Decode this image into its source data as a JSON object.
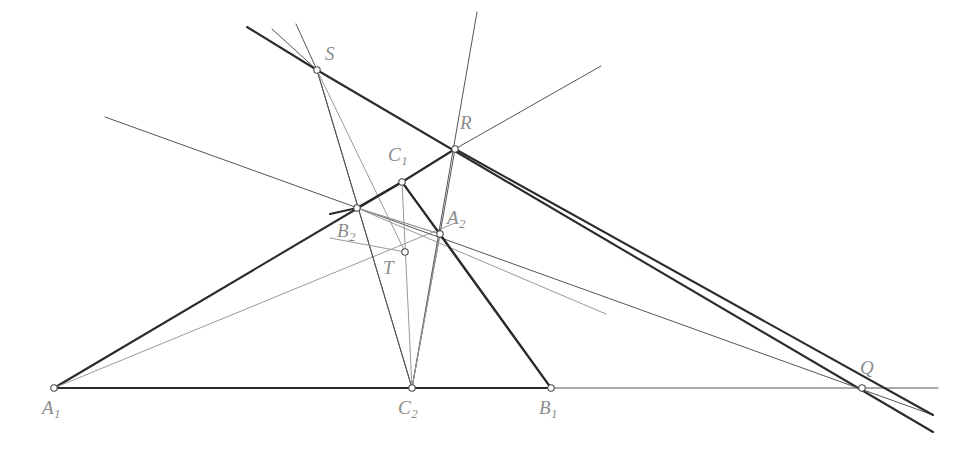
{
  "figure": {
    "background_color": "#ffffff",
    "canvas": {
      "width": 971,
      "height": 455
    }
  },
  "style": {
    "label_color": "#8c8c8c",
    "thick_line_color": "#2b2b2b",
    "thin_line_color": "#555555",
    "light_line_color": "#9a9a9a",
    "vertex_stroke": "#4a4a4a",
    "vertex_fill": "#ffffff",
    "thick_width": 2.1,
    "thin_width": 1.0,
    "light_width": 1.0,
    "vertex_radius": 3.2
  },
  "points": [
    {
      "id": "A1",
      "label": "A",
      "sub": "1",
      "x": 54,
      "y": 388,
      "label_x": 42,
      "label_y": 398
    },
    {
      "id": "B1",
      "label": "B",
      "sub": "1",
      "x": 551,
      "y": 388,
      "label_x": 539,
      "label_y": 398
    },
    {
      "id": "C2",
      "label": "C",
      "sub": "2",
      "x": 412,
      "y": 388,
      "label_x": 398,
      "label_y": 398
    },
    {
      "id": "B2",
      "label": "B",
      "sub": "2",
      "x": 357,
      "y": 208,
      "label_x": 337,
      "label_y": 221
    },
    {
      "id": "C1",
      "label": "C",
      "sub": "1",
      "x": 402,
      "y": 182,
      "label_x": 388,
      "label_y": 145
    },
    {
      "id": "A2",
      "label": "A",
      "sub": "2",
      "x": 440,
      "y": 234,
      "label_x": 447,
      "label_y": 208
    },
    {
      "id": "T",
      "label": "T",
      "sub": "",
      "x": 405,
      "y": 252,
      "label_x": 383,
      "label_y": 258
    },
    {
      "id": "S",
      "label": "S",
      "sub": "",
      "x": 317,
      "y": 70,
      "label_x": 325,
      "label_y": 44
    },
    {
      "id": "R",
      "label": "R",
      "sub": "",
      "x": 455,
      "y": 149,
      "label_x": 460,
      "label_y": 113
    },
    {
      "id": "Q",
      "label": "Q",
      "sub": "",
      "x": 862,
      "y": 388,
      "label_x": 860,
      "label_y": 358
    }
  ],
  "segments": [
    {
      "id": "base-line",
      "from": "A1",
      "to": "Q",
      "weight": "thin",
      "x1": 54,
      "y1": 388,
      "x2": 938,
      "y2": 388
    },
    {
      "id": "A1-B1-base-thick",
      "from": "A1",
      "to": "B1",
      "weight": "thick",
      "x1": 54,
      "y1": 388,
      "x2": 551,
      "y2": 388
    },
    {
      "id": "A1-C1-side",
      "from": "A1",
      "to": "C1",
      "weight": "thick",
      "x1": 54,
      "y1": 388,
      "x2": 402,
      "y2": 182
    },
    {
      "id": "C1-B1-side",
      "from": "C1",
      "to": "B1",
      "weight": "thick",
      "x1": 402,
      "y1": 182,
      "x2": 551,
      "y2": 388
    },
    {
      "id": "A1-A2-cevian",
      "from": "A1",
      "to": "A2",
      "weight": "light",
      "x1": 54,
      "y1": 388,
      "x2": 455,
      "y2": 223
    },
    {
      "id": "B2-A2-light",
      "from": "B2",
      "to": "A2",
      "weight": "light",
      "x1": 357,
      "y1": 208,
      "x2": 606,
      "y2": 314
    },
    {
      "id": "B1-A2-light",
      "from": "B1",
      "to": "A2",
      "weight": "light",
      "x1": 551,
      "y1": 388,
      "x2": 402,
      "y2": 182
    },
    {
      "id": "S-C2-cevian",
      "from": "S",
      "to": "C2",
      "weight": "thin",
      "x1": 317,
      "y1": 70,
      "x2": 412,
      "y2": 388
    },
    {
      "id": "R-C2-cevian",
      "from": "R",
      "to": "C2",
      "weight": "thin",
      "x1": 477,
      "y1": 12,
      "x2": 412,
      "y2": 388
    },
    {
      "id": "A2-C2-cevian",
      "from": "A2",
      "to": "C2",
      "weight": "thin",
      "x1": 440,
      "y1": 234,
      "x2": 412,
      "y2": 388
    },
    {
      "id": "S-up-thick",
      "from": "S",
      "to": "up",
      "weight": "thick",
      "x1": 317,
      "y1": 70,
      "x2": 247,
      "y2": 27
    },
    {
      "id": "S-up-thin-1",
      "from": "S",
      "to": "up",
      "weight": "thin",
      "x1": 317,
      "y1": 70,
      "x2": 272,
      "y2": 29
    },
    {
      "id": "S-up-thin-2",
      "from": "S",
      "to": "up",
      "weight": "thin",
      "x1": 317,
      "y1": 70,
      "x2": 296,
      "y2": 24
    },
    {
      "id": "S-Q-thick",
      "from": "S",
      "to": "Q",
      "weight": "thick",
      "x1": 317,
      "y1": 70,
      "x2": 933,
      "y2": 432
    },
    {
      "id": "S-B2-C2",
      "from": "S",
      "to": "C2",
      "weight": "thin",
      "x1": 317,
      "y1": 70,
      "x2": 412,
      "y2": 388
    },
    {
      "id": "perspectrix-B2RQ",
      "from": "B2",
      "to": "Q",
      "weight": "thin",
      "x1": 105,
      "y1": 117,
      "x2": 933,
      "y2": 415
    },
    {
      "id": "R-upright-ray",
      "from": "R",
      "to": "up",
      "weight": "thin",
      "x1": 455,
      "y1": 149,
      "x2": 601,
      "y2": 66
    },
    {
      "id": "T-S-line",
      "from": "T",
      "to": "S",
      "weight": "light",
      "x1": 405,
      "y1": 252,
      "x2": 317,
      "y2": 70
    },
    {
      "id": "C1-T-median",
      "from": "C1",
      "to": "C2",
      "weight": "light",
      "x1": 402,
      "y1": 182,
      "x2": 412,
      "y2": 388
    },
    {
      "id": "B2-T-light",
      "from": "B2",
      "to": "T",
      "weight": "light",
      "x1": 357,
      "y1": 208,
      "x2": 440,
      "y2": 234
    },
    {
      "id": "A2-T-C2-light",
      "from": "A2",
      "to": "C2",
      "weight": "light",
      "x1": 440,
      "y1": 234,
      "x2": 412,
      "y2": 388
    },
    {
      "id": "A2-B2-T",
      "from": "A2",
      "to": "B2",
      "weight": "light",
      "x1": 440,
      "y1": 234,
      "x2": 357,
      "y2": 208
    },
    {
      "id": "T-left-ray",
      "from": "T",
      "to": "left",
      "weight": "light",
      "x1": 405,
      "y1": 252,
      "x2": 330,
      "y2": 238
    },
    {
      "id": "R-A2-down",
      "from": "R",
      "to": "A2",
      "weight": "thin",
      "x1": 455,
      "y1": 149,
      "x2": 440,
      "y2": 234
    },
    {
      "id": "R-Q-thick",
      "from": "R",
      "to": "Q",
      "weight": "thick",
      "x1": 455,
      "y1": 149,
      "x2": 933,
      "y2": 415
    },
    {
      "id": "C1-R-thick",
      "from": "C1",
      "to": "R",
      "weight": "thick",
      "x1": 402,
      "y1": 182,
      "x2": 455,
      "y2": 149
    },
    {
      "id": "B2-C1-thick",
      "from": "B2",
      "to": "C1",
      "weight": "thick",
      "x1": 357,
      "y1": 208,
      "x2": 402,
      "y2": 182
    },
    {
      "id": "C1-A2-thick",
      "from": "C1",
      "to": "A2",
      "weight": "thick",
      "x1": 402,
      "y1": 182,
      "x2": 440,
      "y2": 234
    },
    {
      "id": "A2-B1-thick",
      "from": "A2",
      "to": "B1",
      "weight": "thick",
      "x1": 440,
      "y1": 234,
      "x2": 551,
      "y2": 388
    },
    {
      "id": "B2-left-thick",
      "from": "B2",
      "to": "left",
      "weight": "thick",
      "x1": 357,
      "y1": 208,
      "x2": 330,
      "y2": 214
    }
  ]
}
